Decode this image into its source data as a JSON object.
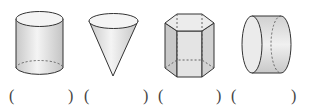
{
  "figures": [
    {
      "name": "cylinder",
      "answer_blank": {
        "open": "(",
        "close": ")"
      }
    },
    {
      "name": "cone",
      "answer_blank": {
        "open": "(",
        "close": ")"
      }
    },
    {
      "name": "hexagonal-prism",
      "answer_blank": {
        "open": "(",
        "close": ")"
      }
    },
    {
      "name": "horizontal-cylinder",
      "answer_blank": {
        "open": "(",
        "close": ")"
      }
    }
  ],
  "colors": {
    "stroke": "#333333",
    "fill_light": "#f2f2f2",
    "fill_mid": "#d9d9d9",
    "fill_dark": "#bfbfbf"
  }
}
